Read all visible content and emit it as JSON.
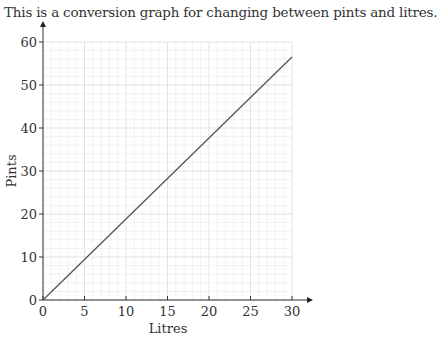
{
  "intro_text": "This is a conversion graph for changing between pints and litres.",
  "chart_data": {
    "type": "line",
    "title": "",
    "xlabel": "Litres",
    "ylabel": "Pints",
    "xlim": [
      0,
      30
    ],
    "ylim": [
      0,
      60
    ],
    "x_ticks": [
      "0",
      "5",
      "10",
      "15",
      "20",
      "25",
      "30"
    ],
    "y_ticks": [
      "0",
      "10",
      "20",
      "30",
      "40",
      "50",
      "60"
    ],
    "grid": true,
    "series": [
      {
        "name": "conversion",
        "x": [
          0,
          30
        ],
        "y": [
          0,
          56.5
        ],
        "color": "#555555"
      }
    ]
  }
}
